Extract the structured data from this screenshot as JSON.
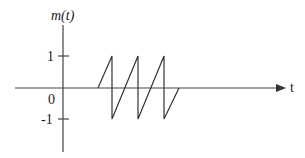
{
  "diagram": {
    "y_label": "m(t)",
    "x_label": "t",
    "y_ticks": [
      {
        "label": "1",
        "value": 1
      },
      {
        "label": "0",
        "value": 0
      },
      {
        "label": "-1",
        "value": -1
      }
    ],
    "waveform": {
      "type": "sawtooth",
      "description": "Three periods of a sawtooth: starts at 0, ramps to 1, drops to -1, ramps to 1 twice more, final ramp from -1 back to 0",
      "points_px": [
        [
          98,
          88
        ],
        [
          112,
          56
        ],
        [
          112,
          119
        ],
        [
          138,
          56
        ],
        [
          138,
          119
        ],
        [
          164,
          56
        ],
        [
          164,
          119
        ],
        [
          179,
          88
        ]
      ]
    },
    "colors": {
      "line": "#333333",
      "text": "#222222",
      "background": "#ffffff"
    }
  }
}
